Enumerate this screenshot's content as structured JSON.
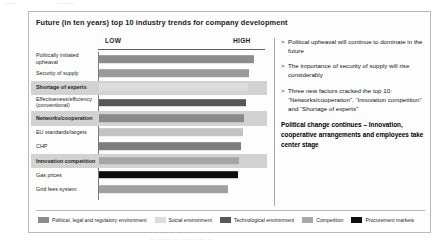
{
  "page": {
    "top_ghost_left": "——",
    "top_ghost_right": "———",
    "caption_ghost": "—  —— — ————  —"
  },
  "slide": {
    "title": "Future (in ten years) top 10 industry trends for company development"
  },
  "axis": {
    "low_label": "LOW",
    "high_label": "HIGH"
  },
  "notes": [
    {
      "bullet": ">",
      "text": "Political upheaval will continue to dominate in the future"
    },
    {
      "bullet": ">",
      "text": "The importance of security of supply will rise considerably"
    },
    {
      "bullet": ">",
      "text": "Three new factors cracked the top 10: “Networks/cooperation”, “Innovation competition” and “Shortage of experts”"
    }
  ],
  "conclusion": "Political change continues – Innovation, cooperative arrangements and employees take center stage",
  "legend": [
    {
      "label": "Political, legal and regulatory environment",
      "color": "#8c8c8c"
    },
    {
      "label": "Social environment",
      "color": "#dcdcdc"
    },
    {
      "label": "Technological environment",
      "color": "#575757"
    },
    {
      "label": "Competition",
      "color": "#a8a8a8"
    },
    {
      "label": "Procurement markets",
      "color": "#0d0d0d"
    }
  ],
  "chart_data": {
    "type": "bar",
    "title": "Future (in ten years) top 10 industry trends for company development",
    "xlabel": "",
    "ylabel": "",
    "orientation": "horizontal",
    "grid": false,
    "legend_position": "bottom",
    "xlim": [
      0,
      100
    ],
    "xtick_labels": [
      "LOW",
      "HIGH"
    ],
    "categories": [
      "Politically initiated upheaval",
      "Security of supply",
      "Shortage of experts",
      "Effectiveness/efficiency\n(conventional)",
      "Networks/cooperation",
      "EU standards/targets",
      "CHP",
      "Innovation competition",
      "Gas prices",
      "Grid fees system"
    ],
    "values": [
      93,
      90,
      89,
      88,
      87,
      86,
      85,
      84,
      83,
      77
    ],
    "bar_colors": [
      "#8c8c8c",
      "#9a9a9a",
      "#dcdcdc",
      "#575757",
      "#8a8a8a",
      "#c2c2c2",
      "#7d7d7d",
      "#a5a5a5",
      "#0d0d0d",
      "#a0a0a0"
    ],
    "bar_categories": [
      "Political, legal and regulatory environment",
      "Political, legal and regulatory environment",
      "Social environment",
      "Technological environment",
      "Competition",
      "Political, legal and regulatory environment",
      "Technological environment",
      "Competition",
      "Procurement markets",
      "Political, legal and regulatory environment"
    ],
    "highlighted": [
      false,
      false,
      true,
      false,
      true,
      false,
      false,
      true,
      false,
      false
    ],
    "tall_row": [
      false,
      false,
      false,
      true,
      false,
      false,
      false,
      false,
      false,
      false
    ]
  }
}
